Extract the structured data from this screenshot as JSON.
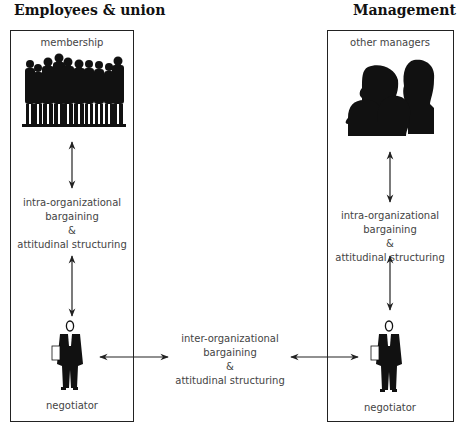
{
  "left_group": {
    "heading": "Employees & union",
    "top_label": "membership",
    "middle_label": [
      "intra-organizational",
      "bargaining",
      "&",
      "attitudinal structuring"
    ],
    "bottom_label": "negotiator",
    "top_icon": "crowd-silhouette-icon",
    "bottom_icon": "businessman-negotiator-icon"
  },
  "right_group": {
    "heading": "Management",
    "top_label": "other managers",
    "middle_label": [
      "intra-organizational",
      "bargaining",
      "&",
      "attitudinal structuring"
    ],
    "bottom_label": "negotiator",
    "top_icon": "heads-silhouette-icon",
    "bottom_icon": "businessman-negotiator-icon"
  },
  "center_label": [
    "inter-organizational",
    "bargaining",
    "&",
    "attitudinal structuring"
  ],
  "colors": {
    "line": "#222222",
    "text": "#444444",
    "heading": "#111111",
    "silhouette": "#111111"
  }
}
